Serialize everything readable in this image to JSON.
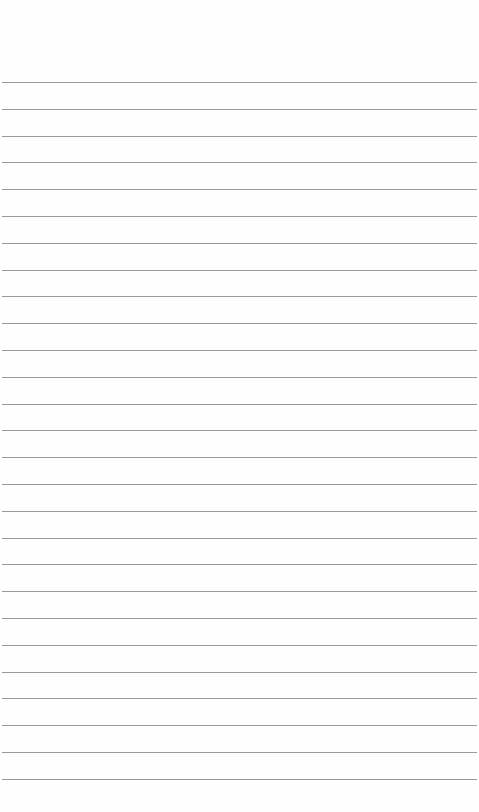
{
  "document": {
    "type": "ruled-paper",
    "background_color": "#fefefe",
    "line_color": "#9a9a9a",
    "line_count": 27,
    "first_line_y": 82,
    "line_spacing": 26.8,
    "lines": []
  }
}
